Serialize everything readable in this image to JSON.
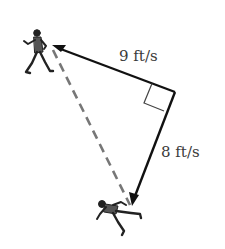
{
  "diagram": {
    "type": "related-rates vector diagram",
    "labels": {
      "horizontal_speed": "9 ft/s",
      "vertical_speed": "8 ft/s"
    },
    "elements": {
      "runner_top_left": "person-walking",
      "runner_bottom": "person-running",
      "right_angle_marker": true,
      "dashed_line": "distance between people"
    },
    "colors": {
      "line": "#111111",
      "dashed": "#777777",
      "text": "#3a3a3a",
      "background": "#ffffff"
    }
  }
}
